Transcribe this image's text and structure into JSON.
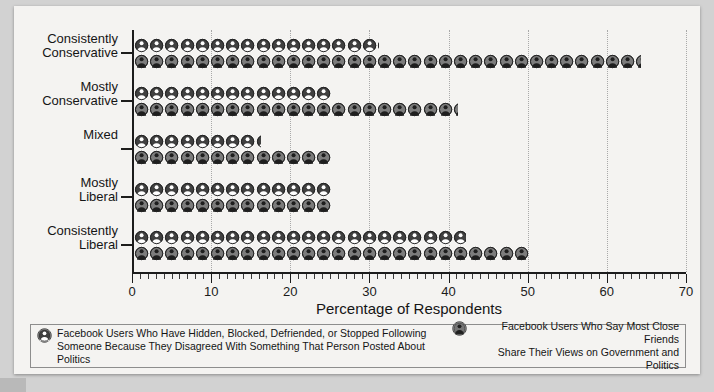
{
  "chart_data": {
    "type": "bar",
    "orientation": "horizontal",
    "style": "pictograph",
    "title": "",
    "xlabel": "Percentage of Respondents",
    "ylabel": "",
    "xlim": [
      0,
      70
    ],
    "xticks": [
      0,
      10,
      20,
      30,
      40,
      50,
      60,
      70
    ],
    "xtick_labels": [
      "0",
      "10",
      "20",
      "30",
      "40",
      "50",
      "60",
      "70"
    ],
    "minor_tick_step": 1,
    "grid": "vertical dotted at major ticks",
    "legend_position": "bottom",
    "categories": [
      "Consistently Conservative",
      "Mostly Conservative",
      "Mixed",
      "Mostly Liberal",
      "Consistently Liberal"
    ],
    "series": [
      {
        "name": "Facebook Users Who Have Hidden, Blocked, Defriended, or Stopped Following Someone Because They Disagreed With Something That Person Posted About Politics",
        "short_name": "hidden-blocked-defriended",
        "values": [
          31,
          25,
          16,
          25,
          42
        ]
      },
      {
        "name": "Facebook Users Who Say Most Close Friends Share Their Views on Government and Politics",
        "short_name": "close-friends-share-views",
        "values": [
          64,
          41,
          25,
          25,
          50
        ]
      }
    ]
  },
  "axis": {
    "x_label": "Percentage of Respondents",
    "tick_labels": [
      "0",
      "10",
      "20",
      "30",
      "40",
      "50",
      "60",
      "70"
    ]
  },
  "categories": [
    {
      "line1": "Consistently",
      "line2": "Conservative"
    },
    {
      "line1": "Mostly",
      "line2": "Conservative"
    },
    {
      "line1": "Mixed",
      "line2": ""
    },
    {
      "line1": "Mostly",
      "line2": "Liberal"
    },
    {
      "line1": "Consistently",
      "line2": "Liberal"
    }
  ],
  "legend": {
    "series_a": {
      "line1": "Facebook Users Who Have Hidden, Blocked, Defriended, or Stopped Following",
      "line2": "Someone Because They Disagreed With Something That Person Posted About Politics",
      "icon": "person-dark-icon"
    },
    "series_b": {
      "line1": "Facebook Users Who Say Most Close Friends",
      "line2": "Share Their Views on Government and Politics",
      "icon": "person-light-icon"
    }
  },
  "colors": {
    "icon_dark": "#3a3a3a",
    "icon_light": "#6e6e6e",
    "axis": "#1c1c1c",
    "grid": "#a9a9a9",
    "sheet_bg": "#f4f3f1",
    "page_bg": "#d2d2d2"
  }
}
